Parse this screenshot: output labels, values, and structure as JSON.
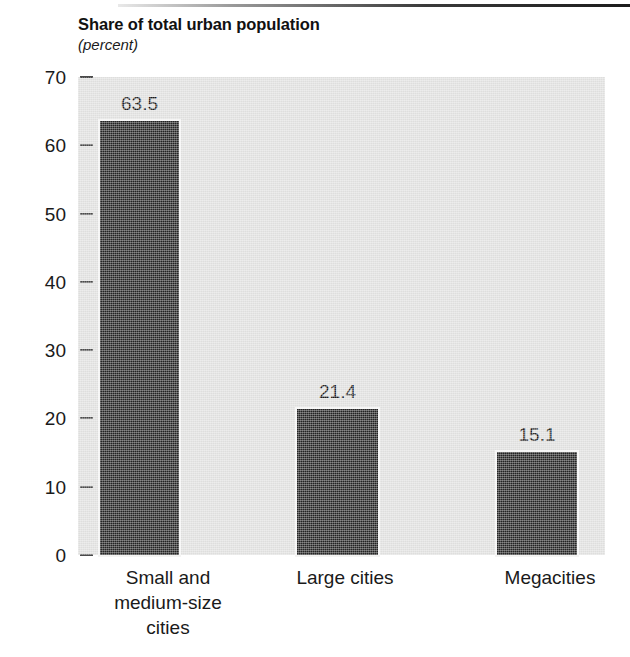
{
  "chart_data": {
    "type": "bar",
    "title": "Share of total urban population",
    "subtitle": "(percent)",
    "xlabel": "",
    "ylabel": "",
    "categories": [
      "Small and medium-size cities",
      "Large cities",
      "Megacities"
    ],
    "category_lines": [
      [
        "Small and",
        "medium-size",
        "cities"
      ],
      [
        "Large cities"
      ],
      [
        "Megacities"
      ]
    ],
    "values": [
      63.5,
      21.4,
      15.1
    ],
    "value_labels": [
      "63.5",
      "21.4",
      "15.1"
    ],
    "ylim": [
      0,
      70
    ],
    "yticks": [
      70,
      60,
      50,
      40,
      30,
      20,
      10,
      0
    ],
    "ytick_labels": [
      "70",
      "60",
      "50",
      "40",
      "30",
      "20",
      "10",
      "0"
    ],
    "grid": false,
    "legend": null,
    "bar_color": "#232323",
    "plot_background": "#dededd"
  }
}
